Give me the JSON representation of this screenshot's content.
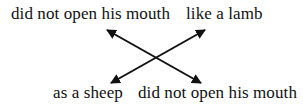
{
  "diagram": {
    "type": "chiasmus",
    "top_left": "did not open his mouth",
    "top_right": "like a lamb",
    "bottom_left": "as a sheep",
    "bottom_right": "did not open his mouth",
    "connections": [
      {
        "from": "top_left",
        "to": "bottom_right",
        "style": "double-arrow"
      },
      {
        "from": "top_right",
        "to": "bottom_left",
        "style": "double-arrow"
      }
    ],
    "colors": {
      "text": "#111111",
      "arrow": "#111111",
      "background": "#ffffff"
    }
  }
}
